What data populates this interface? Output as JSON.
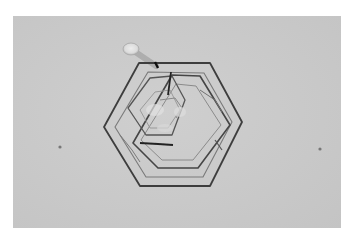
{
  "image": {
    "subject": "hexagonal plate ice crystal micrograph",
    "background_color": "#c9c9c9",
    "line_color": "#3a3a3a",
    "frame": {
      "x": 13,
      "y": 16,
      "width": 328,
      "height": 212
    }
  }
}
